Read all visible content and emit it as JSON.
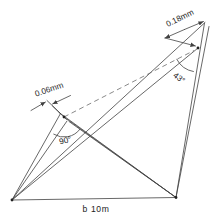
{
  "diagram": {
    "labels": {
      "left_offset": "0.06mm",
      "right_offset": "0.18mm",
      "left_angle": "90°",
      "right_angle": "43°",
      "baseline": "b 10m"
    },
    "colors": {
      "line": "#414141",
      "dashed_line": "#6b6b6b",
      "text": "#1c1c1c",
      "background": "#ffffff"
    }
  }
}
